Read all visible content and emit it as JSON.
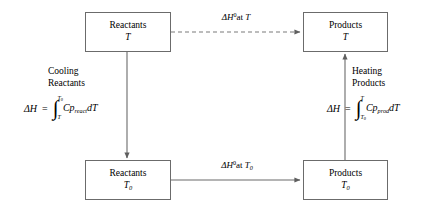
{
  "diagram": {
    "stroke_color": "#6b6b6b",
    "text_color": "#000000",
    "background": "#ffffff",
    "nodes": [
      {
        "id": "reactants-T",
        "name": "Reactants",
        "temperature": "T",
        "temperature_sub": ""
      },
      {
        "id": "products-T",
        "name": "Products",
        "temperature": "T",
        "temperature_sub": ""
      },
      {
        "id": "reactants-T0",
        "name": "Reactants",
        "temperature": "T",
        "temperature_sub": "0"
      },
      {
        "id": "products-T0",
        "name": "Products",
        "temperature": "T",
        "temperature_sub": "0"
      }
    ],
    "edges": [
      {
        "id": "top-reaction",
        "style": "dashed",
        "delta": "ΔH",
        "superscript": "0",
        "at_text": "at",
        "temperature": "T",
        "temperature_sub": ""
      },
      {
        "id": "bottom-reaction",
        "style": "solid",
        "delta": "ΔH",
        "superscript": "0",
        "at_text": "at",
        "temperature": "T",
        "temperature_sub": "0"
      },
      {
        "id": "cooling-reactants",
        "style": "solid",
        "direction": "down"
      },
      {
        "id": "heating-products",
        "style": "solid",
        "direction": "up"
      }
    ],
    "annotations": [
      {
        "id": "cooling-reactants-caption",
        "line1": "Cooling",
        "line2": "Reactants",
        "formula": {
          "lhs": "ΔH",
          "eq": "=",
          "integral_sign": "∫",
          "upper_limit": "T",
          "upper_limit_sub": "0",
          "lower_limit": "T",
          "lower_limit_sub": "",
          "integrand_main": "Cp",
          "integrand_sub": "react",
          "differential": "dT"
        }
      },
      {
        "id": "heating-products-caption",
        "line1": "Heating",
        "line2": "Products",
        "formula": {
          "lhs": "ΔH",
          "eq": "=",
          "integral_sign": "∫",
          "upper_limit": "T",
          "upper_limit_sub": "",
          "lower_limit": "T",
          "lower_limit_sub": "0",
          "integrand_main": "Cp",
          "integrand_sub": "prod",
          "differential": "dT"
        }
      }
    ]
  }
}
